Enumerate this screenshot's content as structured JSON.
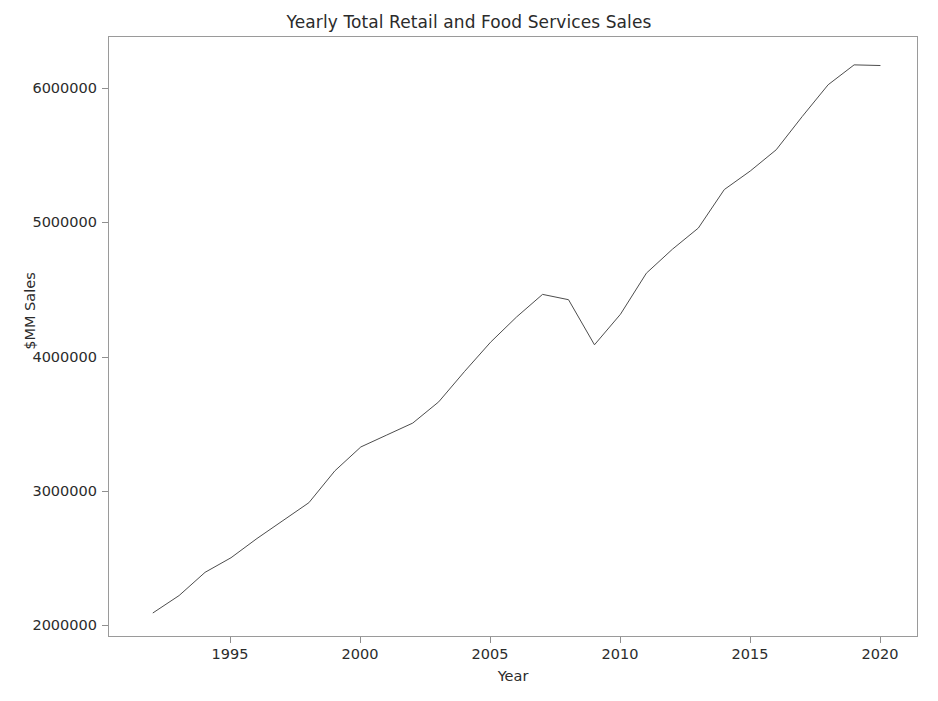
{
  "chart_data": {
    "type": "line",
    "title": "Yearly Total Retail and Food Services Sales",
    "xlabel": "Year",
    "ylabel": "$MM Sales",
    "grid": false,
    "legend": null,
    "xlim": [
      1990.3,
      2021.5
    ],
    "ylim": [
      1860000,
      6390000
    ],
    "xticks": [
      1995,
      2000,
      2005,
      2010,
      2015,
      2020
    ],
    "xtick_labels": [
      "1995",
      "2000",
      "2005",
      "2010",
      "2015",
      "2020"
    ],
    "yticks": [
      2000000,
      3000000,
      4000000,
      5000000,
      6000000
    ],
    "ytick_labels": [
      "2000000",
      "3000000",
      "4000000",
      "5000000",
      "6000000"
    ],
    "line_color": "#4d4d4d",
    "line_width": 1,
    "series": [
      {
        "name": "Total Retail and Food Services Sales",
        "x": [
          1992,
          1993,
          1994,
          1995,
          1996,
          1997,
          1998,
          1999,
          2000,
          2001,
          2002,
          2003,
          2004,
          2005,
          2006,
          2007,
          2008,
          2009,
          2010,
          2011,
          2012,
          2013,
          2014,
          2015,
          2016,
          2017,
          2018,
          2019,
          2020
        ],
        "values": [
          2050000,
          2180000,
          2355000,
          2465000,
          2610000,
          2745000,
          2880000,
          3120000,
          3300000,
          3390000,
          3480000,
          3640000,
          3870000,
          4090000,
          4280000,
          4450000,
          4410000,
          4070000,
          4300000,
          4610000,
          4790000,
          4950000,
          5240000,
          5380000,
          5540000,
          5790000,
          6030000,
          6180000,
          6175000
        ]
      }
    ]
  }
}
